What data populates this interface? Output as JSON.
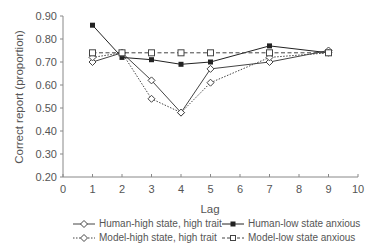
{
  "chart_data": {
    "type": "line",
    "title": "",
    "xlabel": "Lag",
    "ylabel": "Correct report (proportion)",
    "xlim": [
      0,
      10
    ],
    "ylim": [
      0.2,
      0.9
    ],
    "x_ticks": [
      "0",
      "1",
      "2",
      "3",
      "4",
      "5",
      "6",
      "7",
      "8",
      "9",
      "10"
    ],
    "y_ticks": [
      "0.20",
      "0.30",
      "0.40",
      "0.50",
      "0.60",
      "0.70",
      "0.80",
      "0.90"
    ],
    "grid": false,
    "legend_position": "bottom",
    "x": [
      1,
      2,
      3,
      4,
      5,
      7,
      9
    ],
    "series": [
      {
        "name": "Human-high state, high trait",
        "marker": "open-diamond",
        "line": "solid",
        "values": [
          0.7,
          0.74,
          0.62,
          0.48,
          0.67,
          0.7,
          0.75
        ]
      },
      {
        "name": "Human-low state anxious",
        "marker": "filled-square",
        "line": "solid",
        "values": [
          0.86,
          0.72,
          0.71,
          0.69,
          0.7,
          0.77,
          0.74
        ]
      },
      {
        "name": "Model-high state, high trait",
        "marker": "open-diamond",
        "line": "dotted",
        "values": [
          0.72,
          0.74,
          0.54,
          0.48,
          0.61,
          0.72,
          0.74
        ]
      },
      {
        "name": "Model-low state anxious",
        "marker": "open-square",
        "line": "dashed",
        "values": [
          0.74,
          0.74,
          0.74,
          0.74,
          0.74,
          0.74,
          0.74
        ]
      }
    ]
  },
  "legend": {
    "items": [
      {
        "label": "Human-high state, high trait"
      },
      {
        "label": "Human-low state anxious"
      },
      {
        "label": "Model-high state, high trait"
      },
      {
        "label": "Model-low state anxious"
      }
    ]
  }
}
